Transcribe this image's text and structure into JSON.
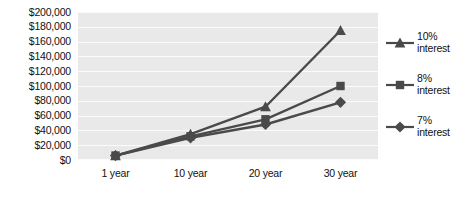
{
  "chart_data": {
    "type": "line",
    "title": "",
    "xlabel": "",
    "ylabel": "",
    "categories": [
      "1 year",
      "10 year",
      "20 year",
      "30 year"
    ],
    "ylim": [
      0,
      200000
    ],
    "ytick_step": 20000,
    "ytick_labels": [
      "$200,000",
      "$180,000",
      "$160,000",
      "$140,000",
      "$120,000",
      "$100,000",
      "$80,000",
      "$60,000",
      "$40,000",
      "$20,000",
      "$0"
    ],
    "ytick_values": [
      200000,
      180000,
      160000,
      140000,
      120000,
      100000,
      80000,
      60000,
      40000,
      20000,
      0
    ],
    "grid": true,
    "legend_position": "right",
    "series": [
      {
        "name": "10% interest",
        "name_line1": "10%",
        "name_line2": "interest",
        "marker": "triangle",
        "color": "#4a4a4a",
        "values": [
          6000,
          35000,
          72000,
          175000
        ]
      },
      {
        "name": "8% interest",
        "name_line1": "8%",
        "name_line2": "interest",
        "marker": "square",
        "color": "#4a4a4a",
        "values": [
          6000,
          32000,
          55000,
          100000
        ]
      },
      {
        "name": "7% interest",
        "name_line1": "7%",
        "name_line2": "interest",
        "marker": "diamond",
        "color": "#4a4a4a",
        "values": [
          6000,
          30000,
          48000,
          78000
        ]
      }
    ],
    "plot_background_color": "#e9e9e9",
    "gridline_color": "#fbfbfb",
    "text_color": "#111111"
  }
}
